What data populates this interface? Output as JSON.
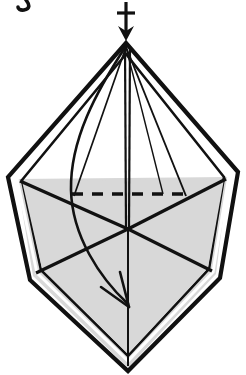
{
  "figure": {
    "type": "origami-instruction-diagram",
    "background_color": "#ffffff",
    "line_color": "#111111",
    "shading_color": "#d8d8d8",
    "shading_color_dark": "#cfcfcf",
    "canvas": {
      "width": 246,
      "height": 375
    },
    "clipped_text_fragment": {
      "label": "g",
      "note": "descender fragment cut off at top-left edge",
      "x": 20,
      "y": 2
    },
    "geometry": {
      "apex": {
        "x": 126,
        "y": 43
      },
      "left_vertex": {
        "x": 12,
        "y": 175
      },
      "right_vertex": {
        "x": 233,
        "y": 173
      },
      "bottom_vertex": {
        "x": 128,
        "y": 368
      },
      "left_lower_bend": {
        "x": 33,
        "y": 276
      },
      "right_lower_bend": {
        "x": 216,
        "y": 274
      },
      "center_meet": {
        "x": 128,
        "y": 228
      },
      "dashed_line": {
        "x1": 72,
        "x2": 186,
        "y": 194
      },
      "horizontal_shade_top_left": {
        "x": 17,
        "y": 179
      },
      "horizontal_shade_top_right": {
        "x": 228,
        "y": 177
      }
    },
    "elements": [
      {
        "name": "push-in-arrow",
        "label": "push in arrow",
        "description": "vertical arrow with crossbar pointing down into the apex",
        "shaft_x": 126,
        "shaft_top_y": 2,
        "shaft_bottom_y": 38,
        "crossbar_y": 13,
        "crossbar_half_width": 9
      },
      {
        "name": "valley-fold-dashed-line",
        "label": "dashed fold line",
        "description": "horizontal dashed line marking the fold crease",
        "dash_pattern": "11 9"
      },
      {
        "name": "curved-fold-arrow",
        "label": "curved fold arrow",
        "description": "curve sweeping from apex down-left then down-right ending in an arrowhead",
        "start": {
          "x": 126,
          "y": 45
        },
        "end": {
          "x": 128,
          "y": 306
        }
      },
      {
        "name": "center-vertical-line",
        "label": "center line",
        "description": "vertical center crease from apex to bottom vertex"
      },
      {
        "name": "outer-outline",
        "label": "outer outline",
        "description": "double-stroked diamond silhouette"
      },
      {
        "name": "shaded-lower-body",
        "label": "shaded lower body",
        "description": "grey filled lower half of the model"
      }
    ]
  }
}
